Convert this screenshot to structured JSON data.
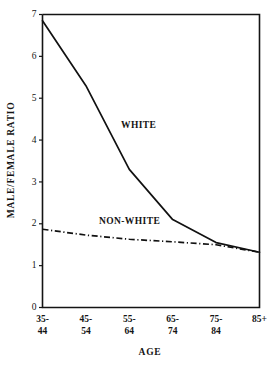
{
  "chart_data": {
    "type": "line",
    "title": "",
    "xlabel": "AGE",
    "ylabel": "MALE/FEMALE RATIO",
    "categories": [
      "35-44",
      "45-54",
      "55-64",
      "65-74",
      "75-84",
      "85+"
    ],
    "category_lines": [
      [
        "35-",
        "44"
      ],
      [
        "45-",
        "54"
      ],
      [
        "55-",
        "64"
      ],
      [
        "65-",
        "74"
      ],
      [
        "75-",
        "84"
      ],
      [
        "85+",
        ""
      ]
    ],
    "ylim": [
      0,
      7
    ],
    "yticks": [
      0,
      1,
      2,
      3,
      4,
      5,
      6,
      7
    ],
    "ytick_labels": [
      "0",
      "1",
      "2",
      "3",
      "4",
      "5",
      "6",
      "7"
    ],
    "grid": false,
    "legend_position": "inline-annotation",
    "series": [
      {
        "name": "WHITE",
        "style": "solid",
        "values": [
          6.85,
          5.3,
          3.3,
          2.1,
          1.55,
          1.32
        ],
        "annotation": "WHITE"
      },
      {
        "name": "NON-WHITE",
        "style": "dash-dot",
        "values": [
          1.87,
          1.73,
          1.63,
          1.57,
          1.5,
          1.32
        ],
        "annotation": "NON-WHITE"
      }
    ],
    "colors": {
      "line": "#111111",
      "axis": "#141414",
      "background": "#ffffff"
    }
  },
  "annotations": {
    "white_label": "WHITE",
    "nonwhite_label": "NON-WHITE"
  }
}
